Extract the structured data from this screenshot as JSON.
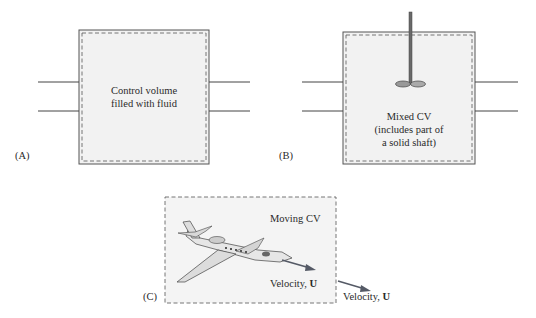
{
  "panels": {
    "a": {
      "label": "(A)",
      "text_line1": "Control volume",
      "text_line2": "filled with fluid"
    },
    "b": {
      "label": "(B)",
      "text_line1": "Mixed CV",
      "text_line2": "(includes part of",
      "text_line3": "a solid shaft)"
    },
    "c": {
      "label": "(C)",
      "title": "Moving CV",
      "inner_velocity_prefix": "Velocity, ",
      "inner_velocity_symbol": "U",
      "outer_velocity_prefix": "Velocity, ",
      "outer_velocity_symbol": "U"
    }
  },
  "colors": {
    "line": "#555555",
    "fill": "#f1f1f1",
    "dash": "#666666",
    "arrow": "#555a66"
  }
}
